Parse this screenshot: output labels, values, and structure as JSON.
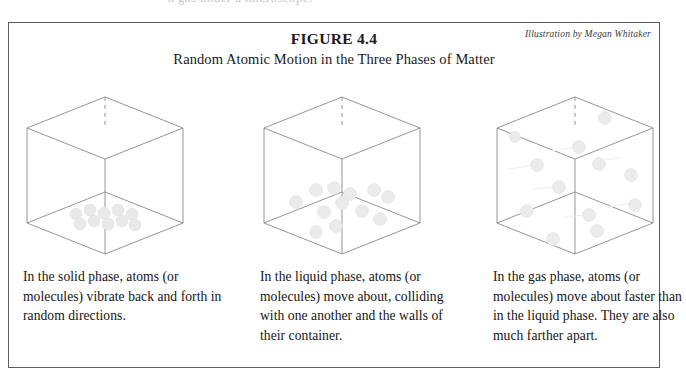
{
  "page": {
    "scan_artifact_text": "a gas  under a microscope."
  },
  "figure": {
    "number_label": "FIGURE 4.4",
    "title": "Random Atomic Motion in the Three Phases of Matter",
    "credit": "Illustration by Megan Whitaker",
    "border_color": "#5f5f5f",
    "sphere_color": "#e8e8e8",
    "edge_color": "#8a8a8a"
  },
  "panels": [
    {
      "id": "solid",
      "phase_name": "solid",
      "caption": "In the solid phase, atoms (or molecules) vibrate back and forth in random directions.",
      "diagram": {
        "type": "isometric-cube",
        "particle_arrangement": "close-packed lattice resting on the floor of the cube",
        "particle_count": 10,
        "motion_trails": false
      }
    },
    {
      "id": "liquid",
      "phase_name": "liquid",
      "caption": "In the liquid phase, atoms (or molecules) move about, colliding with one another and the walls of their container.",
      "diagram": {
        "type": "isometric-cube",
        "particle_arrangement": "loosely scattered in the lower part of the cube",
        "particle_count": 12,
        "motion_trails": false
      }
    },
    {
      "id": "gas",
      "phase_name": "gas",
      "caption": "In the gas phase, atoms (or molecules) move about faster than in the liquid phase.  They are also much farther apart.",
      "diagram": {
        "type": "isometric-cube",
        "particle_arrangement": "spread far apart throughout the whole volume of the cube",
        "particle_count": 12,
        "motion_trails": true
      }
    }
  ]
}
